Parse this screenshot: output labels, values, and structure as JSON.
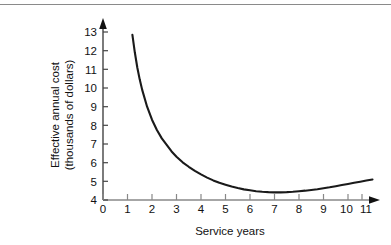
{
  "chart_data": {
    "type": "line",
    "title": "",
    "xlabel": "Service years",
    "ylabel": "Effective annual cost (thousands of dollars)",
    "ylabel_line1": "Effective annual cost",
    "ylabel_line2": "(thousands of dollars)",
    "xlim": [
      0,
      11
    ],
    "ylim": [
      4,
      13
    ],
    "xticks": [
      0,
      1,
      2,
      3,
      4,
      5,
      6,
      7,
      8,
      9,
      10,
      11
    ],
    "yticks": [
      4,
      5,
      6,
      7,
      8,
      9,
      10,
      11,
      12,
      13
    ],
    "xtick_labels": [
      "0",
      "1",
      "2",
      "3",
      "4",
      "5",
      "6",
      "7",
      "8",
      "9",
      "10",
      "11"
    ],
    "ytick_labels": [
      "4",
      "5",
      "6",
      "7",
      "8",
      "9",
      "10",
      "11",
      "12",
      "13"
    ],
    "grid": false,
    "legend": false,
    "axis_arrows": true,
    "line_color": "#1a1a1a",
    "series": [
      {
        "name": "Effective annual cost",
        "x": [
          1.2,
          1.3,
          1.4,
          1.5,
          1.6,
          1.8,
          2.0,
          2.2,
          2.4,
          2.6,
          2.8,
          3.0,
          3.25,
          3.5,
          3.75,
          4.0,
          4.25,
          4.5,
          4.75,
          5.0,
          5.25,
          5.5,
          5.75,
          6.0,
          6.25,
          6.5,
          6.75,
          7.0,
          7.25,
          7.5,
          7.75,
          8.0,
          8.25,
          8.5,
          8.75,
          9.0,
          9.25,
          9.5,
          9.75,
          10.0,
          10.25,
          10.5,
          10.75,
          11.0
        ],
        "y": [
          12.85,
          11.9,
          11.1,
          10.45,
          9.9,
          9.0,
          8.3,
          7.75,
          7.3,
          6.95,
          6.6,
          6.32,
          6.02,
          5.78,
          5.56,
          5.37,
          5.2,
          5.05,
          4.92,
          4.82,
          4.72,
          4.64,
          4.57,
          4.52,
          4.47,
          4.44,
          4.42,
          4.41,
          4.41,
          4.42,
          4.44,
          4.47,
          4.5,
          4.54,
          4.58,
          4.63,
          4.68,
          4.74,
          4.8,
          4.86,
          4.92,
          4.98,
          5.04,
          5.1
        ]
      }
    ],
    "annotations": {
      "minimum_year": 7,
      "minimum_value": 4.41,
      "start_year": 1.2,
      "start_value": 12.85,
      "end_year": 11,
      "end_value": 5.1
    }
  }
}
